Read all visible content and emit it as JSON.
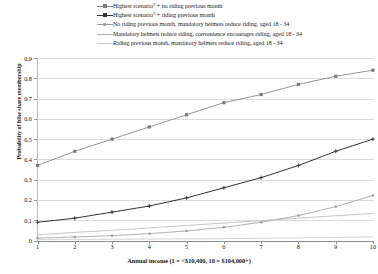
{
  "legend": {
    "position": "top",
    "entries": [
      {
        "label": "Highest scenario° + no riding previous month",
        "color": "#7a7a7a",
        "marker": "square",
        "has_marker": true
      },
      {
        "label": "Highest scenario° + riding previous month",
        "color": "#333333",
        "marker": "plus",
        "has_marker": true
      },
      {
        "label": "No riding previous month, mandatory helmets reduce riding, aged  18 - 34",
        "color": "#9a9a9a",
        "marker": "dot",
        "has_marker": true
      },
      {
        "label": "Mandatory helmets reduce riding, convenience encourages riding,  aged 18 - 34",
        "color": "#b5b5b5",
        "marker": "none",
        "has_marker": false
      },
      {
        "label": "Riding previous month, mandatory helmets reduce riding, aged 18 - 34",
        "color": "#c9c9c9",
        "marker": "none",
        "has_marker": false
      }
    ]
  },
  "axes": {
    "y_title": "Probability of bike share membership",
    "y_ticks": [
      "0",
      "0.1",
      "0.2",
      "0.3",
      "0.4",
      "0.5",
      "0.6",
      "0.7",
      "0.8",
      "0.9"
    ],
    "x_title": "Annual income (1 = <$10,400, 10 = $104,000+)",
    "x_ticks": [
      "1",
      "2",
      "3",
      "4",
      "5",
      "6",
      "7",
      "8",
      "9",
      "10"
    ]
  },
  "chart_data": {
    "type": "line",
    "title": "",
    "xlabel": "Annual income (1 = <$10,400, 10 = $104,000+)",
    "ylabel": "Probability of bike share membership",
    "x": [
      1,
      2,
      3,
      4,
      5,
      6,
      7,
      8,
      9,
      10
    ],
    "xlim": [
      1,
      10
    ],
    "ylim": [
      0,
      0.9
    ],
    "grid": true,
    "legend_position": "top",
    "series": [
      {
        "name": "Highest scenario° + no riding previous month",
        "color": "#7a7a7a",
        "marker": "square",
        "values": [
          0.37,
          0.44,
          0.5,
          0.56,
          0.62,
          0.68,
          0.72,
          0.77,
          0.81,
          0.84
        ]
      },
      {
        "name": "Highest scenario° + riding previous month",
        "color": "#333333",
        "marker": "plus",
        "values": [
          0.09,
          0.11,
          0.14,
          0.17,
          0.21,
          0.26,
          0.31,
          0.37,
          0.44,
          0.5
        ]
      },
      {
        "name": "No riding previous month, mandatory helmets reduce riding, aged  18 - 34",
        "color": "#9a9a9a",
        "marker": "dot",
        "values": [
          0.012,
          0.017,
          0.024,
          0.034,
          0.047,
          0.065,
          0.09,
          0.123,
          0.167,
          0.222
        ]
      },
      {
        "name": "Mandatory helmets reduce riding, convenience encourages riding,  aged 18 - 34",
        "color": "#b5b5b5",
        "marker": "none",
        "values": [
          0.028,
          0.04,
          0.05,
          0.062,
          0.074,
          0.086,
          0.098,
          0.11,
          0.122,
          0.133
        ]
      },
      {
        "name": "Riding previous month, mandatory helmets reduce riding, aged 18 - 34",
        "color": "#c9c9c9",
        "marker": "none",
        "values": [
          0.004,
          0.005,
          0.006,
          0.007,
          0.008,
          0.009,
          0.011,
          0.013,
          0.015,
          0.018
        ]
      }
    ]
  }
}
